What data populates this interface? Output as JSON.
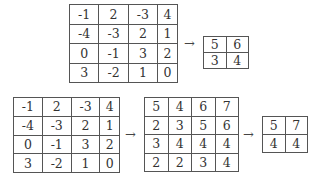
{
  "top_example": {
    "input": [
      [
        "-1",
        "2",
        "-3",
        "4"
      ],
      [
        "-4",
        "-3",
        "2",
        "1"
      ],
      [
        "0",
        "-1",
        "3",
        "2"
      ],
      [
        "3",
        "-2",
        "1",
        "0"
      ]
    ],
    "arrow": "→",
    "output": [
      [
        "5",
        "6"
      ],
      [
        "3",
        "4"
      ]
    ]
  },
  "bottom_example": {
    "input": [
      [
        "-1",
        "2",
        "-3",
        "4"
      ],
      [
        "-4",
        "-3",
        "2",
        "1"
      ],
      [
        "0",
        "-1",
        "3",
        "2"
      ],
      [
        "3",
        "-2",
        "1",
        "0"
      ]
    ],
    "arrow1": "→",
    "intermediate": [
      [
        "5",
        "4",
        "6",
        "7"
      ],
      [
        "2",
        "3",
        "5",
        "6"
      ],
      [
        "3",
        "4",
        "4",
        "4"
      ],
      [
        "2",
        "2",
        "3",
        "4"
      ]
    ],
    "arrow2": "→",
    "output": [
      [
        "5",
        "7"
      ],
      [
        "4",
        "4"
      ]
    ]
  }
}
